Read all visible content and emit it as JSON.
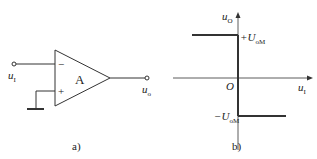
{
  "figure_a": {
    "caption": "a)",
    "amp_label": "A",
    "inverting_sign": "−",
    "noninverting_sign": "+",
    "input": {
      "var": "u",
      "sub": "I"
    },
    "output": {
      "var": "u",
      "sub": "o"
    }
  },
  "figure_b": {
    "caption": "b)",
    "origin": "O",
    "y_axis": {
      "var": "u",
      "sub": "O"
    },
    "x_axis": {
      "var": "u",
      "sub": "I"
    },
    "pos_sat": {
      "prefix": "+U",
      "sub": "oM"
    },
    "neg_sat": {
      "prefix": "−U",
      "sub": "oM"
    }
  }
}
